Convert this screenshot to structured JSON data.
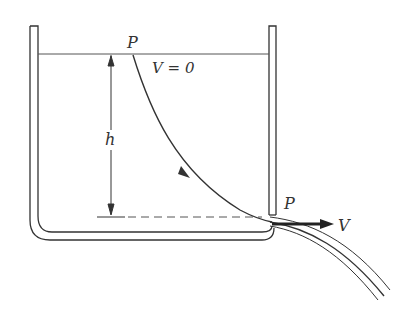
{
  "diagram": {
    "type": "physics-fluid-tank-efflux",
    "labels": {
      "top_point": "P",
      "top_velocity": "V = 0",
      "height": "h",
      "outlet_point": "P",
      "outlet_velocity": "V"
    },
    "colors": {
      "stroke": "#333333",
      "water_line": "#555555",
      "background": "#ffffff"
    }
  }
}
